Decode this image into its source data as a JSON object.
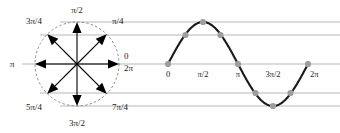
{
  "figure": {
    "colors": {
      "curve": "#1a1a1a",
      "arrow": "#000000",
      "guide_line": "#b8b8b8",
      "circle_outline": "#8a8a8a",
      "point_fill": "#9e9e9e",
      "label": "#1a1a1a",
      "background": "#ffffff"
    }
  },
  "circle": {
    "center_x": 77,
    "center_y": 64,
    "radius": 42,
    "labels": [
      {
        "text": "0",
        "x": 124,
        "y": 59,
        "anchor": "start"
      },
      {
        "text": "2π",
        "x": 124,
        "y": 71,
        "anchor": "start"
      },
      {
        "text": "π/4",
        "x": 112,
        "y": 24,
        "anchor": "start"
      },
      {
        "text": "π/2",
        "x": 77,
        "y": 13,
        "anchor": "middle"
      },
      {
        "text": "3π/4",
        "x": 42,
        "y": 24,
        "anchor": "end"
      },
      {
        "text": "π",
        "x": 10,
        "y": 67,
        "anchor": "start"
      },
      {
        "text": "5π/4",
        "x": 42,
        "y": 110,
        "anchor": "end"
      },
      {
        "text": "3π/2",
        "x": 77,
        "y": 126,
        "anchor": "middle"
      },
      {
        "text": "7π/4",
        "x": 112,
        "y": 110,
        "anchor": "start"
      }
    ],
    "arrows": [
      {
        "name": "arrow-0",
        "angle_deg": 0,
        "label": "0 / 2π"
      },
      {
        "name": "arrow-pi-4",
        "angle_deg": 45,
        "label": "π/4"
      },
      {
        "name": "arrow-pi-2",
        "angle_deg": 90,
        "label": "π/2"
      },
      {
        "name": "arrow-3pi-4",
        "angle_deg": 135,
        "label": "3π/4"
      },
      {
        "name": "arrow-pi",
        "angle_deg": 180,
        "label": "π"
      },
      {
        "name": "arrow-5pi-4",
        "angle_deg": 225,
        "label": "5π/4"
      },
      {
        "name": "arrow-3pi-2",
        "angle_deg": 270,
        "label": "3π/2"
      },
      {
        "name": "arrow-7pi-4",
        "angle_deg": 315,
        "label": "7π/4"
      }
    ]
  },
  "guide_lines": [
    {
      "name": "guide-line-top",
      "y": 22,
      "x1": 60,
      "x2": 340,
      "value": 1.0
    },
    {
      "name": "guide-line-upper",
      "y": 35,
      "x1": 40,
      "x2": 340,
      "value": 0.707
    },
    {
      "name": "guide-line-axis",
      "y": 64,
      "x1": 22,
      "x2": 340,
      "value": 0.0
    },
    {
      "name": "guide-line-lower",
      "y": 93,
      "x1": 40,
      "x2": 340,
      "value": -0.707
    },
    {
      "name": "guide-line-bottom",
      "y": 106,
      "x1": 60,
      "x2": 340,
      "value": -1.0
    }
  ],
  "chart_data": {
    "type": "line",
    "title": "",
    "xlabel": "",
    "ylabel": "",
    "xlim": [
      0,
      6.283185
    ],
    "ylim": [
      -1,
      1
    ],
    "grid": true,
    "legend": null,
    "x_tick_labels": [
      "0",
      "π/2",
      "π",
      "3π/2",
      "2π"
    ],
    "x_tick_values": [
      0,
      1.570796,
      3.141593,
      4.712389,
      6.283185
    ],
    "x_tick_px": [
      168,
      203,
      238,
      273,
      308
    ],
    "axis_y_px": 64,
    "amplitude_px": 42,
    "series": [
      {
        "name": "sin(x)",
        "x": [
          0,
          0.785398,
          1.570796,
          2.356194,
          3.141593,
          3.926991,
          4.712389,
          5.497787,
          6.283185
        ],
        "values": [
          0,
          0.707,
          1.0,
          0.707,
          0,
          -0.707,
          -1.0,
          -0.707,
          0
        ],
        "x_px": [
          168,
          185.5,
          203,
          220.5,
          238,
          255.5,
          273,
          290.5,
          308
        ],
        "y_px": [
          64,
          35,
          22,
          35,
          64,
          93,
          106,
          93,
          64
        ],
        "angle_labels": [
          "0",
          "π/4",
          "π/2",
          "3π/4",
          "π",
          "5π/4",
          "3π/2",
          "7π/4",
          "2π"
        ]
      }
    ],
    "tick_label_positions": [
      {
        "text": "0",
        "x": 168,
        "y": 77,
        "anchor": "middle"
      },
      {
        "text": "π/2",
        "x": 203,
        "y": 77,
        "anchor": "middle"
      },
      {
        "text": "π",
        "x": 238,
        "y": 77,
        "anchor": "middle"
      },
      {
        "text": "3π/2",
        "x": 273,
        "y": 77,
        "anchor": "middle"
      },
      {
        "text": "2π",
        "x": 310,
        "y": 77,
        "anchor": "start"
      }
    ]
  }
}
